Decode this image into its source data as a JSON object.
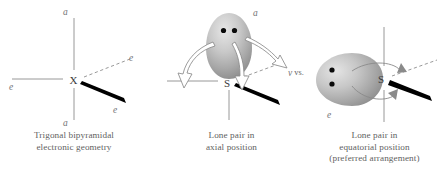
{
  "figure": {
    "background_color": "#ffffff",
    "line_color": "#8d8d8d",
    "text_color": "#5f5f5f",
    "wedge_color": "#000000",
    "lobe_color_light": "#d9d9d9",
    "lobe_color_dark": "#8f8f8f"
  },
  "panels": [
    {
      "id": "panel-1",
      "center_atom": "X",
      "labels": {
        "axial_top": "a",
        "axial_bottom": "a",
        "equatorial_left": "e",
        "equatorial_back": "e",
        "equatorial_front": "e"
      },
      "caption_lines": [
        "Trigonal bipyramidal",
        "electronic geometry"
      ]
    },
    {
      "id": "panel-2",
      "center_atom": "S",
      "labels": {
        "axial_top": "a",
        "equatorial_right": "v"
      },
      "lone_pair_dots": 2,
      "arrow_count": 3,
      "caption_lines": [
        "Lone pair in",
        "axial position"
      ]
    },
    {
      "id": "panel-3",
      "center_atom": "S",
      "labels": {
        "equatorial_lone_pair": "e"
      },
      "lone_pair_dots": 2,
      "arrow_count": 2,
      "caption_lines": [
        "Lone pair in",
        "equatorial position",
        "(preferred arrangement)"
      ]
    }
  ],
  "comparator": {
    "text": "vs."
  }
}
